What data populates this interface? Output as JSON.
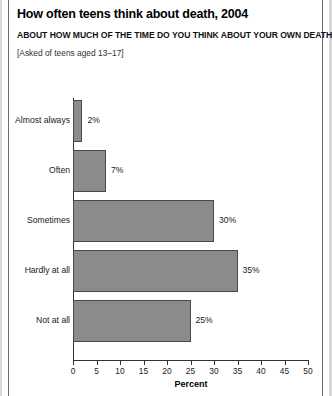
{
  "header": {
    "title": "How often teens think about death, 2004",
    "subtitle": "ABOUT HOW MUCH OF THE TIME DO YOU THINK ABOUT YOUR OWN DEATH?",
    "note": "[Asked of teens aged 13–17]"
  },
  "chart_data": {
    "type": "bar",
    "orientation": "horizontal",
    "title": "How often teens think about death, 2004",
    "subtitle": "ABOUT HOW MUCH OF THE TIME DO YOU THINK ABOUT YOUR OWN DEATH?",
    "annotation": "[Asked of teens aged 13–17]",
    "categories": [
      "Almost always",
      "Often",
      "Sometimes",
      "Hardly at all",
      "Not at all"
    ],
    "values": [
      2,
      7,
      30,
      35,
      25
    ],
    "value_labels": [
      "2%",
      "7%",
      "30%",
      "35%",
      "25%"
    ],
    "xlabel": "Percent",
    "ylabel": "",
    "xlim": [
      0,
      50
    ],
    "xticks": [
      0,
      5,
      10,
      15,
      20,
      25,
      30,
      35,
      40,
      45,
      50
    ],
    "xtick_labels": [
      "0",
      "5",
      "10",
      "15",
      "20",
      "25",
      "30",
      "35",
      "40",
      "45",
      "50"
    ],
    "grid": false,
    "legend": "none",
    "bar_color": "#8b8b8b",
    "bar_edge_color": "#4a4a4a",
    "axis_color": "#333333",
    "background": "#ffffff"
  }
}
